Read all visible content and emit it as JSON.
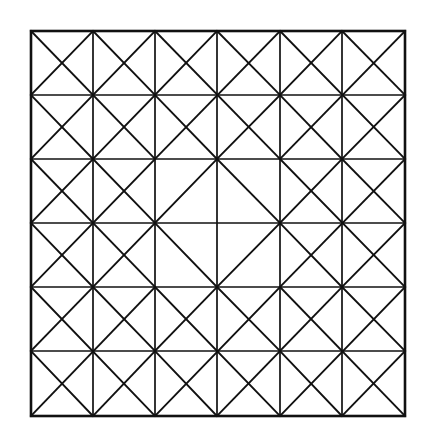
{
  "figure": {
    "title": "Diamond-in-square geometric lattice",
    "type": "line-diagram",
    "background_color": "#ffffff",
    "stroke_color": "#111111",
    "canvas": {
      "width": 427,
      "height": 435
    },
    "grid": {
      "columns": 6,
      "rows": 6,
      "x_coords": [
        31,
        93,
        155,
        217,
        280,
        342,
        405
      ],
      "y_coords": [
        31,
        95,
        159,
        223,
        287,
        351,
        416
      ],
      "outer_border_width": 2.6,
      "inner_line_width": 1.7,
      "diagonal_line_width": 1.9
    },
    "motif": {
      "name": "diamond-in-square",
      "block_size_cells": 2,
      "blocks_across": 3,
      "blocks_down": 3,
      "center_block_index": [
        1,
        1
      ],
      "center_block_is_hollow": true,
      "description": "Each 2x2 cell block carries a diamond joining the midpoints of its four sides; every block except the central one is additionally subdivided by the block's two full diagonals."
    },
    "chart_data": {
      "type": "line-diagram",
      "title": "Diamond-in-square geometric lattice",
      "x_gridlines": [
        31,
        93,
        155,
        217,
        280,
        342,
        405
      ],
      "y_gridlines": [
        31,
        95,
        159,
        223,
        287,
        351,
        416
      ],
      "blocks": [
        {
          "row": 0,
          "col": 0,
          "diamond": true,
          "diagonals": true
        },
        {
          "row": 0,
          "col": 1,
          "diamond": true,
          "diagonals": true
        },
        {
          "row": 0,
          "col": 2,
          "diamond": true,
          "diagonals": true
        },
        {
          "row": 1,
          "col": 0,
          "diamond": true,
          "diagonals": true
        },
        {
          "row": 1,
          "col": 1,
          "diamond": true,
          "diagonals": false
        },
        {
          "row": 1,
          "col": 2,
          "diamond": true,
          "diagonals": true
        },
        {
          "row": 2,
          "col": 0,
          "diamond": true,
          "diagonals": true
        },
        {
          "row": 2,
          "col": 1,
          "diamond": true,
          "diagonals": true
        },
        {
          "row": 2,
          "col": 2,
          "diamond": true,
          "diagonals": true
        }
      ]
    }
  }
}
